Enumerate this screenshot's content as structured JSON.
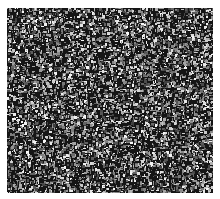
{
  "image": {
    "description": "Grayscale granular noise texture resembling a micrograph of densely packed particles",
    "alt": "granular grayscale texture",
    "bounds": {
      "x": 7,
      "y": 8,
      "width": 206,
      "height": 185
    },
    "background_color": "#ffffff",
    "palette": {
      "dark": "#151515",
      "mid": "#6e6e6e",
      "light": "#d8d8d8",
      "highlight": "#f4f4f4"
    },
    "grain_size_px": 3,
    "seed": 1337
  }
}
